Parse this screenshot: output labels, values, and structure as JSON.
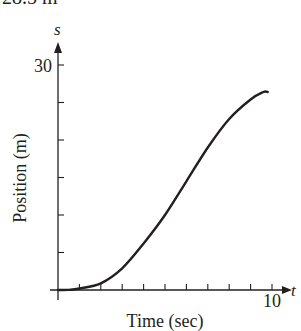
{
  "top_caption": "28.5 m",
  "chart_data": {
    "type": "line",
    "title": "",
    "xlabel": "Time (sec)",
    "ylabel": "Position (m)",
    "x_axis_var": "t",
    "y_axis_var": "s",
    "xlim": [
      0,
      10
    ],
    "ylim": [
      0,
      30
    ],
    "x_ticks": [
      1,
      2,
      3,
      4,
      5,
      6,
      7,
      8,
      9,
      10
    ],
    "x_tick_labels": {
      "10": "10"
    },
    "y_ticks": [
      5,
      10,
      15,
      20,
      25,
      30
    ],
    "y_tick_labels": {
      "30": "30"
    },
    "grid": false,
    "legend": null,
    "series": [
      {
        "name": "s(t)",
        "x": [
          0,
          0.5,
          1,
          2,
          3,
          4,
          5,
          6,
          7,
          8,
          9,
          9.6,
          9.8
        ],
        "y": [
          0,
          0.02,
          0.2,
          0.9,
          2.9,
          6.2,
          10.0,
          14.5,
          19.0,
          22.8,
          25.4,
          26.4,
          26.4
        ]
      }
    ]
  }
}
